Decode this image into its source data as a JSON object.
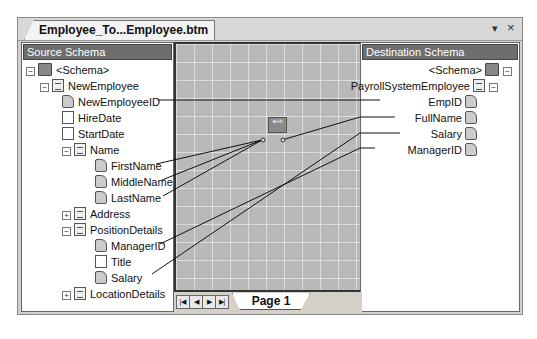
{
  "document_tab": {
    "title": "Employee_To...Employee.btm"
  },
  "window_controls": {
    "dropdown": "▾",
    "close": "×"
  },
  "source_schema": {
    "header": "Source Schema",
    "nodes": [
      {
        "label": "<Schema>",
        "type": "folder",
        "expander": "−"
      },
      {
        "label": "NewEmployee",
        "type": "record",
        "expander": "−"
      },
      {
        "label": "NewEmployeeID",
        "type": "field"
      },
      {
        "label": "HireDate",
        "type": "attribute"
      },
      {
        "label": "StartDate",
        "type": "attribute"
      },
      {
        "label": "Name",
        "type": "record",
        "expander": "−"
      },
      {
        "label": "FirstName",
        "type": "field"
      },
      {
        "label": "MiddleName",
        "type": "field"
      },
      {
        "label": "LastName",
        "type": "field"
      },
      {
        "label": "Address",
        "type": "record",
        "expander": "+"
      },
      {
        "label": "PositionDetails",
        "type": "record",
        "expander": "−"
      },
      {
        "label": "ManagerID",
        "type": "field"
      },
      {
        "label": "Title",
        "type": "attribute"
      },
      {
        "label": "Salary",
        "type": "field"
      },
      {
        "label": "LocationDetails",
        "type": "record",
        "expander": "+"
      }
    ]
  },
  "destination_schema": {
    "header": "Destination Schema",
    "nodes": [
      {
        "label": "<Schema>",
        "type": "folder",
        "expander": "−"
      },
      {
        "label": "PayrollSystemEmployee",
        "type": "record",
        "expander": "−"
      },
      {
        "label": "EmpID",
        "type": "field"
      },
      {
        "label": "FullName",
        "type": "field"
      },
      {
        "label": "Salary",
        "type": "field"
      },
      {
        "label": "ManagerID",
        "type": "field"
      }
    ]
  },
  "grid": {
    "functoid": {
      "name": "string-concatenate-functoid",
      "label": "a+b"
    },
    "links": [
      {
        "from": "NewEmployeeID",
        "to": "EmpID"
      },
      {
        "from": "FirstName",
        "to": "functoid"
      },
      {
        "from": "MiddleName",
        "to": "functoid"
      },
      {
        "from": "LastName",
        "to": "functoid"
      },
      {
        "from": "functoid",
        "to": "FullName"
      },
      {
        "from": "ManagerID",
        "to": "ManagerID"
      },
      {
        "from": "Salary",
        "to": "Salary"
      }
    ]
  },
  "page_nav": {
    "first": "|◀",
    "prev": "◀",
    "next": "▶",
    "last": "▶|",
    "page_tab": "Page 1"
  }
}
